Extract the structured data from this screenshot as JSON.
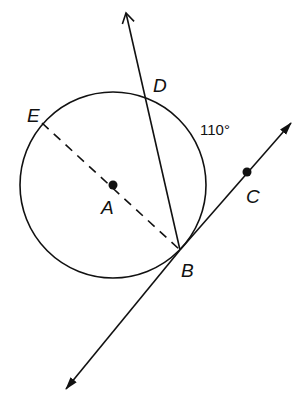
{
  "diagram": {
    "type": "geometry-circle-tangent",
    "stroke_color": "#111111",
    "background": "#ffffff",
    "circle": {
      "center": "A",
      "cx": 113,
      "cy": 185,
      "r": 93
    },
    "points": [
      {
        "id": "A",
        "label": "A",
        "x": 113,
        "y": 185,
        "dot": true,
        "label_x": 101,
        "label_y": 214
      },
      {
        "id": "B",
        "label": "B",
        "x": 180,
        "y": 250,
        "dot": false,
        "label_x": 181,
        "label_y": 277
      },
      {
        "id": "C",
        "label": "C",
        "x": 247,
        "y": 172,
        "dot": true,
        "label_x": 246,
        "label_y": 203
      },
      {
        "id": "D",
        "label": "D",
        "x": 146,
        "y": 96,
        "dot": false,
        "label_x": 153,
        "label_y": 92
      },
      {
        "id": "E",
        "label": "E",
        "x": 42,
        "y": 123,
        "dot": false,
        "label_x": 27,
        "label_y": 122
      }
    ],
    "arc_measure": {
      "text": "110°",
      "x": 200,
      "y": 135
    },
    "segments": [
      {
        "name": "diameter-EB",
        "style": "dashed"
      },
      {
        "name": "ray-BD",
        "style": "solid-arrow"
      },
      {
        "name": "tangent-line-BC",
        "style": "solid-double-arrow"
      }
    ]
  }
}
